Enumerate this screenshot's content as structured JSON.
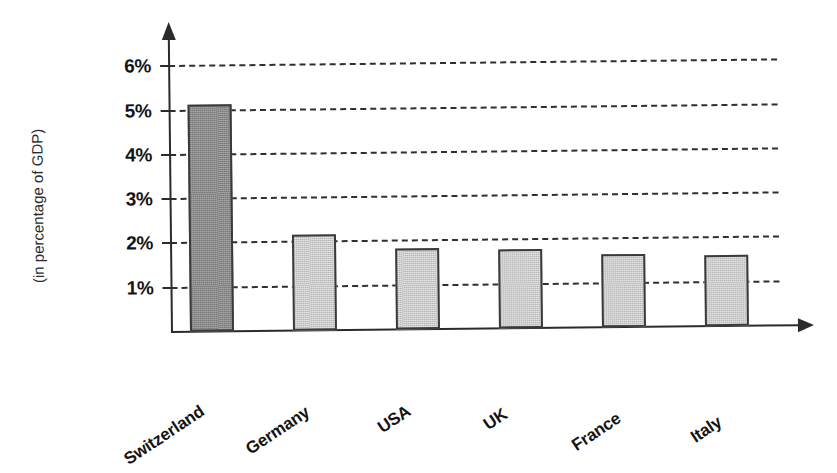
{
  "chart_data": {
    "type": "bar",
    "title": "",
    "subtitle": "",
    "xlabel": "",
    "ylabel": "(in percentage of GDP)",
    "categories": [
      "Switzerland",
      "Germany",
      "USA",
      "UK",
      "France",
      "Italy"
    ],
    "values": [
      5.1,
      2.15,
      1.82,
      1.78,
      1.65,
      1.6
    ],
    "ylim": [
      0,
      6.5
    ],
    "ytick_values": [
      1,
      2,
      3,
      4,
      5,
      6
    ],
    "ytick_labels": [
      "1%",
      "2%",
      "3%",
      "4%",
      "5%",
      "6%"
    ],
    "grid": "horizontal-dashed",
    "legend": "none",
    "series": [
      {
        "name": "Spending as share of GDP",
        "values": [
          5.1,
          2.15,
          1.82,
          1.78,
          1.65,
          1.6
        ]
      }
    ],
    "bar_colors": [
      "#8a8a8a",
      "#cbcbcb",
      "#cbcbcb",
      "#cbcbcb",
      "#cbcbcb",
      "#cbcbcb"
    ],
    "bar_edge_color": "#3a3a3a",
    "axis_color": "#2b2b2b",
    "grid_color": "#2f2f2f",
    "background": "#ffffff",
    "highlight_category": "Switzerland"
  },
  "axes": {
    "y_title": "(in percentage of GDP)",
    "ticks": [
      {
        "label": "6%",
        "value": 6
      },
      {
        "label": "5%",
        "value": 5
      },
      {
        "label": "4%",
        "value": 4
      },
      {
        "label": "3%",
        "value": 3
      },
      {
        "label": "2%",
        "value": 2
      },
      {
        "label": "1%",
        "value": 1
      }
    ]
  },
  "bars": [
    {
      "label": "Switzerland",
      "value": 5.1
    },
    {
      "label": "Germany",
      "value": 2.15
    },
    {
      "label": "USA",
      "value": 1.82
    },
    {
      "label": "UK",
      "value": 1.78
    },
    {
      "label": "France",
      "value": 1.65
    },
    {
      "label": "Italy",
      "value": 1.6
    }
  ]
}
